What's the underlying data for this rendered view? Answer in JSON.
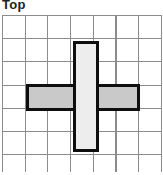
{
  "figure_label": "Top",
  "figure": {
    "grid": {
      "columns": 7,
      "rows": 7,
      "cell_size_px": 23,
      "line_color": "#8c8c8c",
      "background": "#ffffff"
    },
    "shapes": {
      "horizontal_bar": {
        "fill": "#c9c9c9",
        "stroke": "#0e0e0e",
        "row": 4,
        "columns_span": "2-6"
      },
      "vertical_bar": {
        "fill": "#ededed",
        "stroke": "#0e0e0e",
        "column": 4,
        "rows_span": "2-6",
        "z_order": "above horizontal bar"
      }
    }
  }
}
